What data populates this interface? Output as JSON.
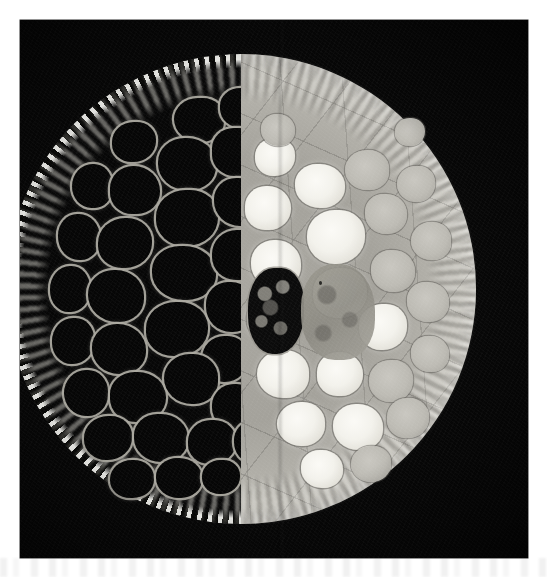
{
  "figure": {
    "kind": "micrograph",
    "caption": "",
    "background_color": "#ffffff",
    "plate": {
      "frame_color": "#070707",
      "x": 20,
      "y": 20,
      "width": 508,
      "height": 538,
      "split_axis": "vertical",
      "split_x_px": 281,
      "halves": [
        {
          "side": "left",
          "modality_label": "dark-field",
          "lumen_color": "#060606",
          "wall_color": "#acaaa2",
          "cortex_color": "#ecebe2",
          "description": "dark cell lumens outlined by bright cell walls with a speckled small-celled cortex ring"
        },
        {
          "side": "right",
          "modality_label": "bright-field",
          "tissue_color": "#a9a7a0",
          "lumen_color": "#fbfaf6",
          "wall_color": "#46443f",
          "rim_color": "#d8d6cf",
          "description": "pale grey tissue with bright white cell lumens and a light fibrous outer rim"
        }
      ]
    },
    "specimen": {
      "shape": "circle",
      "center_x_px": 241,
      "center_y_px": 289,
      "diameter_px": 470
    },
    "artifacts": {
      "ghost_text_band": true,
      "film_grain": true,
      "vignette": true
    },
    "cells_left": [
      {
        "x": 168,
        "y": 44,
        "w": 50,
        "h": 44,
        "r": "48% 42% 46% 52%"
      },
      {
        "x": 214,
        "y": 34,
        "w": 46,
        "h": 40,
        "r": "44% 50% 42% 48%"
      },
      {
        "x": 106,
        "y": 68,
        "w": 44,
        "h": 40,
        "r": "50% 44% 52% 44%"
      },
      {
        "x": 152,
        "y": 84,
        "w": 58,
        "h": 52,
        "r": "46% 50% 44% 50%"
      },
      {
        "x": 206,
        "y": 74,
        "w": 52,
        "h": 48,
        "r": "42% 48% 50% 44%"
      },
      {
        "x": 66,
        "y": 110,
        "w": 40,
        "h": 44,
        "r": "52% 46% 44% 50%"
      },
      {
        "x": 104,
        "y": 112,
        "w": 50,
        "h": 48,
        "r": "46% 52% 46% 44%"
      },
      {
        "x": 150,
        "y": 136,
        "w": 62,
        "h": 56,
        "r": "48% 44% 50% 46%"
      },
      {
        "x": 208,
        "y": 124,
        "w": 50,
        "h": 48,
        "r": "44% 50% 44% 52%"
      },
      {
        "x": 244,
        "y": 108,
        "w": 34,
        "h": 40,
        "r": "50% 44% 48% 46%"
      },
      {
        "x": 52,
        "y": 160,
        "w": 42,
        "h": 46,
        "r": "46% 50% 46% 50%"
      },
      {
        "x": 92,
        "y": 164,
        "w": 54,
        "h": 50,
        "r": "50% 46% 50% 44%"
      },
      {
        "x": 146,
        "y": 192,
        "w": 64,
        "h": 54,
        "r": "44% 50% 46% 50%"
      },
      {
        "x": 206,
        "y": 176,
        "w": 52,
        "h": 50,
        "r": "48% 44% 50% 46%"
      },
      {
        "x": 246,
        "y": 160,
        "w": 34,
        "h": 44,
        "r": "46% 50% 44% 50%"
      },
      {
        "x": 44,
        "y": 212,
        "w": 40,
        "h": 46,
        "r": "50% 46% 48% 46%"
      },
      {
        "x": 82,
        "y": 216,
        "w": 56,
        "h": 52,
        "r": "46% 50% 44% 52%"
      },
      {
        "x": 140,
        "y": 248,
        "w": 62,
        "h": 54,
        "r": "48% 46% 50% 44%"
      },
      {
        "x": 200,
        "y": 228,
        "w": 50,
        "h": 50,
        "r": "44% 50% 46% 50%"
      },
      {
        "x": 46,
        "y": 264,
        "w": 42,
        "h": 46,
        "r": "50% 44% 50% 46%"
      },
      {
        "x": 86,
        "y": 270,
        "w": 54,
        "h": 50,
        "r": "46% 52% 44% 50%"
      },
      {
        "x": 196,
        "y": 282,
        "w": 46,
        "h": 46,
        "r": "48% 44% 50% 48%"
      },
      {
        "x": 58,
        "y": 316,
        "w": 44,
        "h": 46,
        "r": "50% 46% 46% 50%"
      },
      {
        "x": 104,
        "y": 318,
        "w": 56,
        "h": 50,
        "r": "44% 50% 48% 46%"
      },
      {
        "x": 158,
        "y": 300,
        "w": 54,
        "h": 50,
        "r": "48% 46% 44% 52%"
      },
      {
        "x": 206,
        "y": 330,
        "w": 48,
        "h": 46,
        "r": "46% 50% 46% 48%"
      },
      {
        "x": 78,
        "y": 362,
        "w": 48,
        "h": 44,
        "r": "50% 44% 50% 46%"
      },
      {
        "x": 128,
        "y": 360,
        "w": 54,
        "h": 48,
        "r": "44% 50% 46% 50%"
      },
      {
        "x": 182,
        "y": 366,
        "w": 48,
        "h": 44,
        "r": "48% 46% 50% 44%"
      },
      {
        "x": 228,
        "y": 368,
        "w": 34,
        "h": 40,
        "r": "46% 50% 44% 50%"
      },
      {
        "x": 104,
        "y": 406,
        "w": 44,
        "h": 38,
        "r": "50% 46% 48% 46%"
      },
      {
        "x": 150,
        "y": 404,
        "w": 46,
        "h": 40,
        "r": "46% 50% 46% 50%"
      },
      {
        "x": 196,
        "y": 406,
        "w": 38,
        "h": 34,
        "r": "48% 44% 50% 46%"
      },
      {
        "x": 240,
        "y": 204,
        "w": 30,
        "h": 34,
        "r": "50% 46% 46% 50%"
      },
      {
        "x": 240,
        "y": 344,
        "w": 30,
        "h": 32,
        "r": "46% 50% 48% 46%"
      }
    ],
    "cells_right": [
      {
        "x": 14,
        "y": 84,
        "w": 40,
        "h": 38,
        "r": "48% 44% 50% 46%",
        "dim": false
      },
      {
        "x": 54,
        "y": 110,
        "w": 50,
        "h": 44,
        "r": "44% 50% 46% 50%",
        "dim": false
      },
      {
        "x": 104,
        "y": 96,
        "w": 44,
        "h": 40,
        "r": "50% 46% 44% 50%",
        "dim": true
      },
      {
        "x": 4,
        "y": 132,
        "w": 46,
        "h": 44,
        "r": "46% 50% 48% 44%",
        "dim": false
      },
      {
        "x": 66,
        "y": 156,
        "w": 58,
        "h": 54,
        "r": "48% 44% 50% 48%",
        "dim": false
      },
      {
        "x": 124,
        "y": 140,
        "w": 42,
        "h": 40,
        "r": "44% 50% 46% 50%",
        "dim": true
      },
      {
        "x": 156,
        "y": 112,
        "w": 38,
        "h": 36,
        "r": "50% 44% 48% 50%",
        "dim": true
      },
      {
        "x": 10,
        "y": 186,
        "w": 50,
        "h": 48,
        "r": "46% 50% 44% 50%",
        "dim": false
      },
      {
        "x": 72,
        "y": 214,
        "w": 54,
        "h": 50,
        "r": "48% 46% 50% 44%",
        "dim": false
      },
      {
        "x": 130,
        "y": 196,
        "w": 44,
        "h": 42,
        "r": "44% 50% 46% 50%",
        "dim": true
      },
      {
        "x": 170,
        "y": 168,
        "w": 40,
        "h": 38,
        "r": "50% 46% 44% 50%",
        "dim": true
      },
      {
        "x": 6,
        "y": 244,
        "w": 44,
        "h": 42,
        "r": "46% 50% 48% 46%",
        "dim": false
      },
      {
        "x": 118,
        "y": 250,
        "w": 48,
        "h": 46,
        "r": "48% 44% 50% 46%",
        "dim": false
      },
      {
        "x": 166,
        "y": 228,
        "w": 42,
        "h": 40,
        "r": "44% 50% 46% 50%",
        "dim": true
      },
      {
        "x": 16,
        "y": 296,
        "w": 52,
        "h": 48,
        "r": "50% 46% 44% 50%",
        "dim": false
      },
      {
        "x": 76,
        "y": 298,
        "w": 46,
        "h": 44,
        "r": "46% 50% 48% 44%",
        "dim": false
      },
      {
        "x": 128,
        "y": 306,
        "w": 44,
        "h": 42,
        "r": "48% 44% 50% 48%",
        "dim": true
      },
      {
        "x": 170,
        "y": 282,
        "w": 38,
        "h": 36,
        "r": "44% 50% 46% 50%",
        "dim": true
      },
      {
        "x": 36,
        "y": 348,
        "w": 48,
        "h": 44,
        "r": "50% 46% 46% 50%",
        "dim": false
      },
      {
        "x": 92,
        "y": 350,
        "w": 50,
        "h": 46,
        "r": "46% 50% 44% 50%",
        "dim": false
      },
      {
        "x": 146,
        "y": 344,
        "w": 42,
        "h": 40,
        "r": "48% 46% 50% 44%",
        "dim": true
      },
      {
        "x": 60,
        "y": 396,
        "w": 42,
        "h": 38,
        "r": "44% 50% 46% 50%",
        "dim": false
      },
      {
        "x": 110,
        "y": 392,
        "w": 40,
        "h": 36,
        "r": "50% 44% 48% 50%",
        "dim": true
      },
      {
        "x": 20,
        "y": 60,
        "w": 34,
        "h": 32,
        "r": "46% 50% 46% 50%",
        "dim": true
      },
      {
        "x": 154,
        "y": 64,
        "w": 30,
        "h": 28,
        "r": "48% 46% 50% 46%",
        "dim": true
      }
    ]
  }
}
